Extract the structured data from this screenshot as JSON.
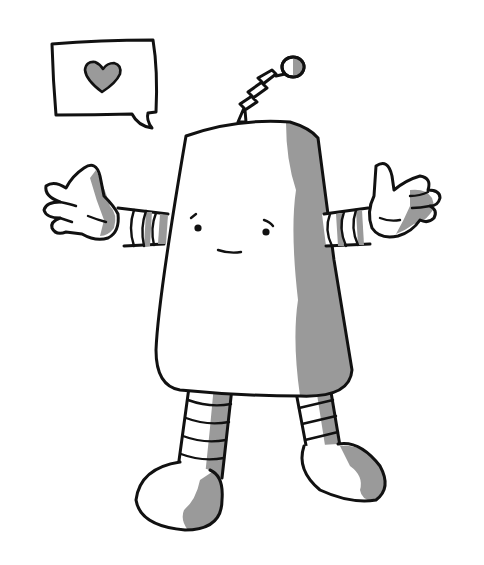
{
  "illustration": {
    "subject": "friendly-robot-shrugging",
    "speech_bubble": {
      "icon": "heart-icon"
    },
    "colors": {
      "background": "#ffffff",
      "line": "#111111",
      "shade": "#999999",
      "fill": "#ffffff"
    },
    "expression": "gentle-smile-raised-brows",
    "pose": "arms-out-palms-up"
  }
}
